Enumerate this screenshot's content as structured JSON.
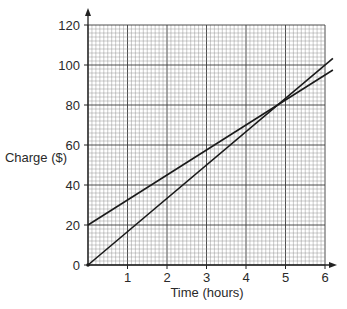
{
  "chart_data": {
    "type": "line",
    "title": "",
    "xlabel": "Time (hours)",
    "ylabel": "Charge ($)",
    "xlim": [
      0,
      6
    ],
    "ylim": [
      0,
      120
    ],
    "x_ticks": [
      1,
      2,
      3,
      4,
      5,
      6
    ],
    "y_ticks": [
      0,
      20,
      40,
      60,
      80,
      100,
      120
    ],
    "grid": true,
    "grid_minor_per_major_x": 10,
    "grid_minor_per_major_y": 10,
    "series": [
      {
        "name": "Line A",
        "x": [
          0,
          6.2
        ],
        "y": [
          20,
          97.5
        ],
        "intercept": 20,
        "slope": 12.5
      },
      {
        "name": "Line B",
        "x": [
          0,
          6.2
        ],
        "y": [
          0,
          103.3
        ],
        "intercept": 0,
        "slope": 16.67
      }
    ],
    "intersection": {
      "x": 4.8,
      "y": 80
    },
    "colors": {
      "line": "#1a1a1a",
      "grid": "#8a8a8a",
      "axis": "#222222"
    }
  }
}
